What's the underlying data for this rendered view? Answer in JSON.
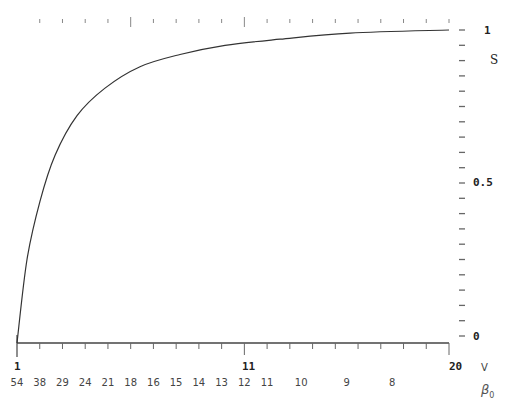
{
  "chart_data": {
    "type": "line",
    "title": "",
    "xlabel": "V",
    "xlabel_secondary": "β0",
    "ylabel": "S",
    "xlim": [
      1,
      20
    ],
    "ylim": [
      0,
      1
    ],
    "grid": false,
    "legend": null,
    "x_major_tick_labels": [
      "1",
      "11",
      "20"
    ],
    "x_major_tick_values": [
      1,
      11,
      20
    ],
    "x_minor_tick_step": 1,
    "beta0_tick_labels": [
      "54",
      "38",
      "29",
      "24",
      "21",
      "18",
      "16",
      "15",
      "14",
      "13",
      "12",
      "11",
      "10",
      "9",
      "8"
    ],
    "beta0_tick_positions_V": [
      1,
      2,
      3,
      4,
      5,
      6,
      7,
      8,
      9,
      10,
      11,
      12,
      13.5,
      15.5,
      17.5
    ],
    "y_tick_labels": [
      "0",
      "0.5",
      "1"
    ],
    "y_tick_values": [
      0,
      0.5,
      1
    ],
    "y_minor_tick_step": 0.05,
    "series": [
      {
        "name": "S(V)",
        "x": [
          1.0,
          1.44,
          2.01,
          2.67,
          3.64,
          4.87,
          6.41,
          8.17,
          10.15,
          12.57,
          15.65,
          20.0
        ],
        "y": [
          0.0,
          0.25,
          0.44,
          0.59,
          0.72,
          0.81,
          0.88,
          0.92,
          0.95,
          0.97,
          0.99,
          1.0
        ]
      }
    ]
  },
  "labels": {
    "x_axis_name": "V",
    "beta_axis_name": "β",
    "beta_axis_sub": "0",
    "y_axis_name": "S",
    "x_left": "1",
    "x_mid": "11",
    "x_right": "20",
    "y_top": "1",
    "y_mid": "0.5",
    "y_bottom": "0",
    "beta": [
      "54",
      "38",
      "29",
      "24",
      "21",
      "18",
      "16",
      "15",
      "14",
      "13",
      "12",
      "11",
      "10",
      "9",
      "8"
    ]
  },
  "colors": {
    "line": "#333333",
    "axis": "#444444",
    "ticks": "#666666"
  }
}
